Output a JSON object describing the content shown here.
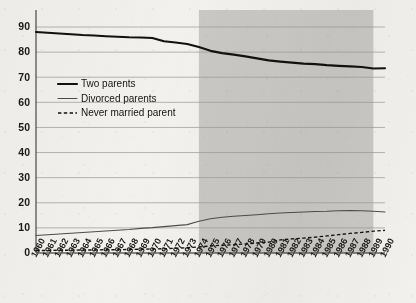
{
  "chart_data": {
    "type": "line",
    "title": "",
    "xlabel": "",
    "ylabel": "",
    "ylim": [
      0,
      90
    ],
    "ytick_values": [
      0,
      10,
      20,
      30,
      40,
      50,
      60,
      70,
      80,
      90
    ],
    "grid": true,
    "legend_position": "upper-left-inside",
    "x": [
      1960,
      1961,
      1962,
      1963,
      1964,
      1965,
      1966,
      1967,
      1968,
      1969,
      1970,
      1971,
      1972,
      1973,
      1974,
      1975,
      1976,
      1977,
      1978,
      1979,
      1980,
      1981,
      1982,
      1983,
      1984,
      1985,
      1986,
      1987,
      1988,
      1989,
      1990
    ],
    "xtick_labels": [
      "1960",
      "1961",
      "1962",
      "1963",
      "1964",
      "1965",
      "1966",
      "1967",
      "1968",
      "1969",
      "1970",
      "1971",
      "1972",
      "1973",
      "1974",
      "1975",
      "1976",
      "1977",
      "1978",
      "1979",
      "1980",
      "1981",
      "1982",
      "1983",
      "1984",
      "1985",
      "1986",
      "1987",
      "1988",
      "1989",
      "1990"
    ],
    "shaded_region": {
      "start": 1974,
      "end": 1989,
      "color": "#c9c8c4"
    },
    "series": [
      {
        "name": "Two parents",
        "style": "solid-thick",
        "color": "#111111",
        "values": [
          88.0,
          87.7,
          87.4,
          87.1,
          86.8,
          86.6,
          86.3,
          86.1,
          85.9,
          85.8,
          85.6,
          84.3,
          83.8,
          83.2,
          82.0,
          80.5,
          79.6,
          79.0,
          78.3,
          77.5,
          76.7,
          76.2,
          75.8,
          75.4,
          75.2,
          74.8,
          74.5,
          74.3,
          74.1,
          73.5,
          73.6
        ]
      },
      {
        "name": "Divorced parents",
        "style": "solid-thin",
        "color": "#4d4d4d",
        "values": [
          7.0,
          7.3,
          7.6,
          7.9,
          8.2,
          8.5,
          8.8,
          9.1,
          9.4,
          9.8,
          10.1,
          10.5,
          10.9,
          11.3,
          12.6,
          13.6,
          14.2,
          14.6,
          14.9,
          15.2,
          15.6,
          15.9,
          16.1,
          16.3,
          16.5,
          16.6,
          16.8,
          16.9,
          16.8,
          16.6,
          16.3
        ]
      },
      {
        "name": "Never married parent",
        "style": "dashed",
        "color": "#111111",
        "values": [
          1.0,
          1.0,
          1.1,
          1.1,
          1.2,
          1.2,
          1.3,
          1.3,
          1.4,
          1.5,
          1.6,
          1.7,
          1.9,
          2.1,
          2.4,
          2.8,
          3.1,
          3.3,
          3.6,
          4.0,
          4.3,
          5.2,
          5.6,
          5.9,
          6.3,
          6.8,
          7.3,
          7.8,
          8.2,
          8.7,
          9.0
        ]
      }
    ]
  },
  "legend": {
    "items": [
      {
        "label": "Two parents"
      },
      {
        "label": "Divorced parents"
      },
      {
        "label": "Never married parent"
      }
    ]
  }
}
